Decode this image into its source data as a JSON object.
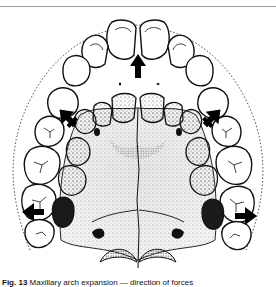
{
  "figure": {
    "arrows": [
      {
        "id": "anterior",
        "direction": "up",
        "x": 138,
        "y": 72
      },
      {
        "id": "left-canine",
        "direction": "up-left",
        "x": 68,
        "y": 118
      },
      {
        "id": "right-canine",
        "direction": "up-right",
        "x": 212,
        "y": 118
      },
      {
        "id": "left-molar",
        "direction": "left",
        "x": 35,
        "y": 210
      },
      {
        "id": "right-molar",
        "direction": "right",
        "x": 245,
        "y": 215
      }
    ],
    "colors": {
      "ink": "#111111",
      "stipple": "#555555",
      "paper": "#ffffff",
      "rule": "#9a9a9a"
    }
  },
  "caption": {
    "label": "Fig. 13",
    "text": "Maxillary arch expansion — direction of forces"
  }
}
